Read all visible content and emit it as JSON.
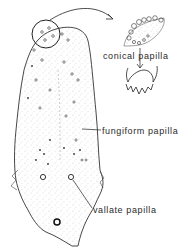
{
  "figure": {
    "labels": {
      "conical": "conical papilla",
      "fungiform": "fungiform papilla",
      "vallate": "vallate papilla"
    },
    "colors": {
      "ink": "#2a2a2a",
      "background": "#ffffff"
    }
  }
}
